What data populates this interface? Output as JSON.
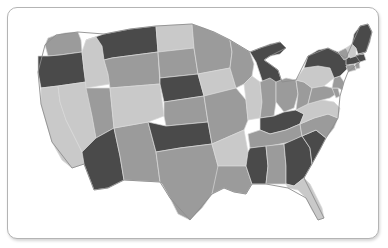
{
  "card": {
    "background": "#ffffff",
    "border_color": "#b4b4b4",
    "corner_radius_px": 10
  },
  "map": {
    "title": "United States choropleth map",
    "projection_note": "contiguous 48 states, Albers-like",
    "outline_color": "#8d8d8d",
    "state_border_color": "#d8d8d8",
    "palette": {
      "dark": "#4a4a4a",
      "medium": "#9b9b9b",
      "light": "#c9c9c9"
    },
    "legend_visible": false,
    "labels_visible": false,
    "states": [
      {
        "code": "WA",
        "name": "Washington",
        "shade": "medium",
        "color": "#9b9b9b"
      },
      {
        "code": "OR",
        "name": "Oregon",
        "shade": "dark",
        "color": "#4a4a4a"
      },
      {
        "code": "CA",
        "name": "California",
        "shade": "light",
        "color": "#c9c9c9"
      },
      {
        "code": "NV",
        "name": "Nevada",
        "shade": "light",
        "color": "#c9c9c9"
      },
      {
        "code": "ID",
        "name": "Idaho",
        "shade": "light",
        "color": "#c9c9c9"
      },
      {
        "code": "MT",
        "name": "Montana",
        "shade": "dark",
        "color": "#4a4a4a"
      },
      {
        "code": "WY",
        "name": "Wyoming",
        "shade": "medium",
        "color": "#9b9b9b"
      },
      {
        "code": "UT",
        "name": "Utah",
        "shade": "medium",
        "color": "#9b9b9b"
      },
      {
        "code": "AZ",
        "name": "Arizona",
        "shade": "dark",
        "color": "#4a4a4a"
      },
      {
        "code": "NM",
        "name": "New Mexico",
        "shade": "medium",
        "color": "#9b9b9b"
      },
      {
        "code": "CO",
        "name": "Colorado",
        "shade": "light",
        "color": "#c9c9c9"
      },
      {
        "code": "ND",
        "name": "North Dakota",
        "shade": "light",
        "color": "#c9c9c9"
      },
      {
        "code": "SD",
        "name": "South Dakota",
        "shade": "medium",
        "color": "#9b9b9b"
      },
      {
        "code": "NE",
        "name": "Nebraska",
        "shade": "dark",
        "color": "#4a4a4a"
      },
      {
        "code": "KS",
        "name": "Kansas",
        "shade": "medium",
        "color": "#9b9b9b"
      },
      {
        "code": "OK",
        "name": "Oklahoma",
        "shade": "dark",
        "color": "#4a4a4a"
      },
      {
        "code": "TX",
        "name": "Texas",
        "shade": "medium",
        "color": "#9b9b9b"
      },
      {
        "code": "MN",
        "name": "Minnesota",
        "shade": "medium",
        "color": "#9b9b9b"
      },
      {
        "code": "IA",
        "name": "Iowa",
        "shade": "light",
        "color": "#c9c9c9"
      },
      {
        "code": "MO",
        "name": "Missouri",
        "shade": "medium",
        "color": "#9b9b9b"
      },
      {
        "code": "AR",
        "name": "Arkansas",
        "shade": "light",
        "color": "#c9c9c9"
      },
      {
        "code": "LA",
        "name": "Louisiana",
        "shade": "medium",
        "color": "#9b9b9b"
      },
      {
        "code": "WI",
        "name": "Wisconsin",
        "shade": "medium",
        "color": "#9b9b9b"
      },
      {
        "code": "IL",
        "name": "Illinois",
        "shade": "light",
        "color": "#c9c9c9"
      },
      {
        "code": "MI",
        "name": "Michigan",
        "shade": "dark",
        "color": "#4a4a4a"
      },
      {
        "code": "IN",
        "name": "Indiana",
        "shade": "medium",
        "color": "#9b9b9b"
      },
      {
        "code": "OH",
        "name": "Ohio",
        "shade": "medium",
        "color": "#9b9b9b"
      },
      {
        "code": "KY",
        "name": "Kentucky",
        "shade": "dark",
        "color": "#4a4a4a"
      },
      {
        "code": "TN",
        "name": "Tennessee",
        "shade": "medium",
        "color": "#9b9b9b"
      },
      {
        "code": "MS",
        "name": "Mississippi",
        "shade": "dark",
        "color": "#4a4a4a"
      },
      {
        "code": "AL",
        "name": "Alabama",
        "shade": "medium",
        "color": "#9b9b9b"
      },
      {
        "code": "GA",
        "name": "Georgia",
        "shade": "dark",
        "color": "#4a4a4a"
      },
      {
        "code": "FL",
        "name": "Florida",
        "shade": "light",
        "color": "#c9c9c9"
      },
      {
        "code": "SC",
        "name": "South Carolina",
        "shade": "dark",
        "color": "#4a4a4a"
      },
      {
        "code": "NC",
        "name": "North Carolina",
        "shade": "medium",
        "color": "#9b9b9b"
      },
      {
        "code": "VA",
        "name": "Virginia",
        "shade": "light",
        "color": "#c9c9c9"
      },
      {
        "code": "WV",
        "name": "West Virginia",
        "shade": "medium",
        "color": "#9b9b9b"
      },
      {
        "code": "MD",
        "name": "Maryland",
        "shade": "medium",
        "color": "#9b9b9b"
      },
      {
        "code": "DE",
        "name": "Delaware",
        "shade": "medium",
        "color": "#9b9b9b"
      },
      {
        "code": "PA",
        "name": "Pennsylvania",
        "shade": "light",
        "color": "#c9c9c9"
      },
      {
        "code": "NJ",
        "name": "New Jersey",
        "shade": "medium",
        "color": "#9b9b9b"
      },
      {
        "code": "NY",
        "name": "New York",
        "shade": "dark",
        "color": "#4a4a4a"
      },
      {
        "code": "CT",
        "name": "Connecticut",
        "shade": "medium",
        "color": "#9b9b9b"
      },
      {
        "code": "RI",
        "name": "Rhode Island",
        "shade": "medium",
        "color": "#9b9b9b"
      },
      {
        "code": "MA",
        "name": "Massachusetts",
        "shade": "dark",
        "color": "#4a4a4a"
      },
      {
        "code": "VT",
        "name": "Vermont",
        "shade": "medium",
        "color": "#9b9b9b"
      },
      {
        "code": "NH",
        "name": "New Hampshire",
        "shade": "light",
        "color": "#c9c9c9"
      },
      {
        "code": "ME",
        "name": "Maine",
        "shade": "dark",
        "color": "#4a4a4a"
      }
    ]
  }
}
